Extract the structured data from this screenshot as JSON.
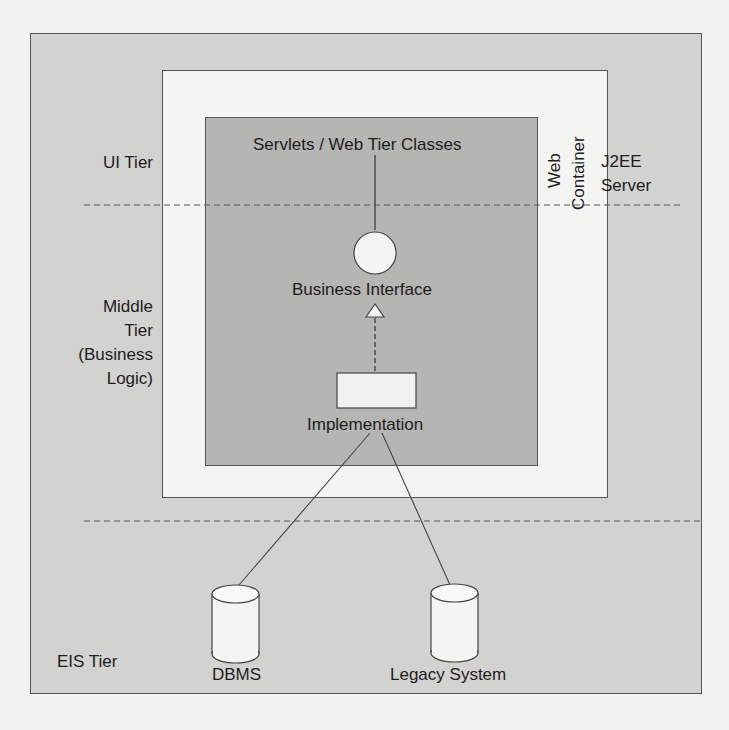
{
  "diagram": {
    "server_label_line1": "J2EE",
    "server_label_line2": "Server",
    "web_container_line1": "Web",
    "web_container_line2": "Container",
    "tiers": {
      "ui": "UI Tier",
      "middle_line1": "Middle",
      "middle_line2": "Tier",
      "middle_line3": "(Business",
      "middle_line4": "Logic)",
      "eis": "EIS Tier"
    },
    "nodes": {
      "servlets": "Servlets / Web Tier Classes",
      "business_interface": "Business Interface",
      "implementation": "Implementation",
      "dbms": "DBMS",
      "legacy": "Legacy System"
    }
  }
}
